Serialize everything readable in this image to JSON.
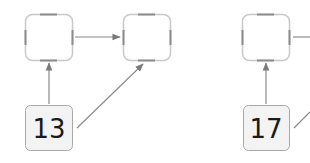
{
  "diagram": {
    "groups": [
      {
        "value_box": {
          "label": "13"
        },
        "slots": [
          {
            "label": ""
          },
          {
            "label": ""
          }
        ]
      },
      {
        "value_box": {
          "label": "17"
        },
        "slots": [
          {
            "label": ""
          }
        ]
      }
    ],
    "colors": {
      "slot_border": "#b4b4b4",
      "slot_dash": "#8c8c8c",
      "value_box_fill": "#f3f3f3",
      "value_box_border": "#a8a8a8",
      "arrow": "#8a8a8a",
      "text": "#1a1a1a"
    }
  }
}
